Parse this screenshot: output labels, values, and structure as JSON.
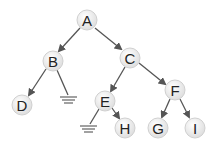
{
  "diagram": {
    "type": "binary-tree",
    "nodes": [
      {
        "id": "A",
        "label": "A",
        "x": 87,
        "y": 20
      },
      {
        "id": "B",
        "label": "B",
        "x": 53,
        "y": 61
      },
      {
        "id": "C",
        "label": "C",
        "x": 130,
        "y": 58
      },
      {
        "id": "D",
        "label": "D",
        "x": 22,
        "y": 105
      },
      {
        "id": "E",
        "label": "E",
        "x": 105,
        "y": 101
      },
      {
        "id": "F",
        "label": "F",
        "x": 175,
        "y": 90
      },
      {
        "id": "H",
        "label": "H",
        "x": 125,
        "y": 128
      },
      {
        "id": "G",
        "label": "G",
        "x": 158,
        "y": 128
      },
      {
        "id": "I",
        "label": "I",
        "x": 195,
        "y": 128
      }
    ],
    "edges": [
      {
        "from": "A",
        "to": "B"
      },
      {
        "from": "A",
        "to": "C"
      },
      {
        "from": "B",
        "to": "D"
      },
      {
        "from": "B",
        "to": "null"
      },
      {
        "from": "C",
        "to": "E"
      },
      {
        "from": "C",
        "to": "F"
      },
      {
        "from": "E",
        "to": "null"
      },
      {
        "from": "E",
        "to": "H"
      },
      {
        "from": "F",
        "to": "G"
      },
      {
        "from": "F",
        "to": "I"
      }
    ],
    "null_markers": [
      {
        "parent": "B",
        "x": 69,
        "y": 97
      },
      {
        "parent": "E",
        "x": 89,
        "y": 126
      }
    ],
    "colors": {
      "node_fill": "#f2f2f2",
      "node_stroke": "#d0d0d0",
      "edge": "#555555"
    }
  }
}
